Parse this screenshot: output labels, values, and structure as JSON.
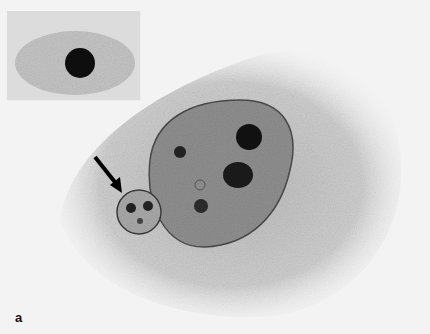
{
  "figure": {
    "panel_label": "a",
    "colors": {
      "background": "#f3f3f3",
      "cytoplasm": "#c8c8c8",
      "nucleus": "#9a9a9a",
      "dark": "#151515"
    }
  }
}
